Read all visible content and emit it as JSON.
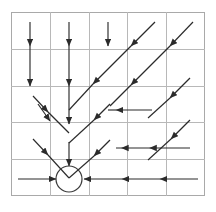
{
  "figure": {
    "title": "",
    "caption": "",
    "type": "vector-field-flow-diagram",
    "background_color": "#ffffff",
    "border_color": "#a9a9a9",
    "grid_color": "#b4b4b4",
    "arrow_color": "#2b2b2b",
    "circle_color": "#3a3a3a"
  },
  "chart_data": {
    "type": "scatter",
    "title": "",
    "subtitle": "",
    "xlabel": "",
    "ylabel": "",
    "grid": true,
    "legend": null,
    "xlim": [
      0,
      5
    ],
    "ylim": [
      0,
      5
    ],
    "xticks": [
      0,
      1,
      2,
      3,
      4,
      5
    ],
    "yticks": [
      0,
      1,
      2,
      3,
      4,
      5
    ],
    "xtick_labels": [
      "",
      "",
      "",
      "",
      "",
      ""
    ],
    "ytick_labels": [
      "",
      "",
      "",
      "",
      "",
      ""
    ],
    "grid_columns": 5,
    "grid_rows": 5,
    "plot_box": {
      "x0": 11,
      "y0": 12,
      "x1": 205,
      "y1": 196
    },
    "cell_width": 38.8,
    "cell_height": 36.8,
    "equilibrium_point": {
      "x": 1.5,
      "y": 0.5,
      "px": 69,
      "py": 179,
      "radius_px": 13,
      "label": ""
    },
    "arrows": [
      {
        "name": "down-col1-upper",
        "x1": 30,
        "y1": 22,
        "x2": 30,
        "y2": 46,
        "head": "end"
      },
      {
        "name": "down-col1-mid",
        "x1": 30,
        "y1": 46,
        "x2": 30,
        "y2": 86,
        "head": "end"
      },
      {
        "name": "down-col2-upper",
        "x1": 69,
        "y1": 22,
        "x2": 69,
        "y2": 46,
        "head": "end"
      },
      {
        "name": "down-col2-mid",
        "x1": 69,
        "y1": 46,
        "x2": 69,
        "y2": 86,
        "head": "end"
      },
      {
        "name": "down-col2-lower",
        "x1": 69,
        "y1": 86,
        "x2": 69,
        "y2": 124,
        "head": "end"
      },
      {
        "name": "down-col2-bottom",
        "x1": 69,
        "y1": 142,
        "x2": 69,
        "y2": 166,
        "head": "end"
      },
      {
        "name": "down-col3-upper",
        "x1": 108,
        "y1": 22,
        "x2": 108,
        "y2": 46,
        "head": "end"
      },
      {
        "name": "diag-sw-a1",
        "x1": 155,
        "y1": 22,
        "x2": 131,
        "y2": 46,
        "head": "end"
      },
      {
        "name": "diag-sw-a2",
        "x1": 131,
        "y1": 46,
        "x2": 93,
        "y2": 84,
        "head": "end"
      },
      {
        "name": "diag-sw-a3",
        "x1": 93,
        "y1": 84,
        "x2": 69,
        "y2": 110,
        "head": "none"
      },
      {
        "name": "diag-sw-b1",
        "x1": 193,
        "y1": 22,
        "x2": 170,
        "y2": 46,
        "head": "end"
      },
      {
        "name": "diag-sw-b2",
        "x1": 170,
        "y1": 46,
        "x2": 131,
        "y2": 85,
        "head": "end"
      },
      {
        "name": "diag-sw-b3",
        "x1": 131,
        "y1": 85,
        "x2": 110,
        "y2": 106,
        "head": "none"
      },
      {
        "name": "diag-sw-c1",
        "x1": 190,
        "y1": 78,
        "x2": 170,
        "y2": 98,
        "head": "end"
      },
      {
        "name": "diag-sw-c2",
        "x1": 170,
        "y1": 98,
        "x2": 148,
        "y2": 118,
        "head": "none"
      },
      {
        "name": "diag-sw-d1",
        "x1": 190,
        "y1": 120,
        "x2": 171,
        "y2": 139,
        "head": "end"
      },
      {
        "name": "diag-sw-d2",
        "x1": 171,
        "y1": 139,
        "x2": 148,
        "y2": 160,
        "head": "none"
      },
      {
        "name": "diag-sw-e1",
        "x1": 38,
        "y1": 104,
        "x2": 50,
        "y2": 121,
        "head": "end"
      },
      {
        "name": "diag-se-left-top",
        "x1": 33,
        "y1": 96,
        "x2": 48,
        "y2": 112,
        "head": "end"
      },
      {
        "name": "diag-se-left-bottom",
        "x1": 48,
        "y1": 112,
        "x2": 69,
        "y2": 133,
        "head": "none"
      },
      {
        "name": "diag-se-left2-top",
        "x1": 33,
        "y1": 139,
        "x2": 48,
        "y2": 155,
        "head": "end"
      },
      {
        "name": "diag-se-left2-bottom",
        "x1": 48,
        "y1": 155,
        "x2": 69,
        "y2": 178,
        "head": "none"
      },
      {
        "name": "diag-sw-right-top",
        "x1": 110,
        "y1": 104,
        "x2": 94,
        "y2": 120,
        "head": "end"
      },
      {
        "name": "diag-sw-right-bottom",
        "x1": 94,
        "y1": 120,
        "x2": 69,
        "y2": 143,
        "head": "none"
      },
      {
        "name": "diag-sw-right2-top",
        "x1": 110,
        "y1": 140,
        "x2": 94,
        "y2": 156,
        "head": "end"
      },
      {
        "name": "diag-sw-right2-bottom",
        "x1": 94,
        "y1": 156,
        "x2": 69,
        "y2": 178,
        "head": "none"
      },
      {
        "name": "elbow-mid-horiz",
        "x1": 152,
        "y1": 110,
        "x2": 116,
        "y2": 110,
        "head": "end"
      },
      {
        "name": "elbow-mid-diag",
        "x1": 116,
        "y1": 110,
        "x2": 108,
        "y2": 110,
        "head": "none"
      },
      {
        "name": "elbow-low-horiz",
        "x1": 190,
        "y1": 148,
        "x2": 116,
        "y2": 148,
        "head": "mid"
      },
      {
        "name": "left-in-bottom",
        "x1": 18,
        "y1": 179,
        "x2": 56,
        "y2": 179,
        "head": "end"
      },
      {
        "name": "right-in-bottom-1",
        "x1": 122,
        "y1": 179,
        "x2": 84,
        "y2": 179,
        "head": "end"
      },
      {
        "name": "right-in-bottom-2",
        "x1": 160,
        "y1": 179,
        "x2": 122,
        "y2": 179,
        "head": "end"
      },
      {
        "name": "right-in-bottom-3",
        "x1": 198,
        "y1": 179,
        "x2": 160,
        "y2": 179,
        "head": "end"
      }
    ]
  }
}
